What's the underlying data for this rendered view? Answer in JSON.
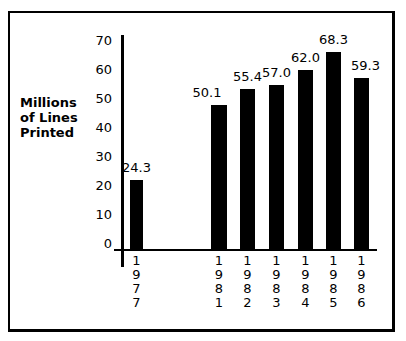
{
  "chart_data": {
    "type": "bar",
    "title": "",
    "xlabel": "",
    "ylabel": "Millions of Lines Printed",
    "ylim": [
      0,
      70
    ],
    "yticks": [
      0,
      10,
      20,
      30,
      40,
      50,
      60,
      70
    ],
    "categories": [
      "1977",
      "1981",
      "1982",
      "1983",
      "1984",
      "1985",
      "1986"
    ],
    "values": [
      24.3,
      50.1,
      55.4,
      57.0,
      62.0,
      68.3,
      59.3
    ],
    "value_labels": [
      "24.3",
      "50.1",
      "55.4",
      "57.0",
      "62.0",
      "68.3",
      "59.3"
    ],
    "grid": false,
    "legend": null
  },
  "labels": {
    "ylabel_lines": "Millions\nof Lines\nPrinted",
    "cut_title": "",
    "yticks": [
      "0",
      "10",
      "20",
      "30",
      "40",
      "50",
      "60",
      "70"
    ],
    "xlabels_vertical": [
      "1\n9\n7\n7",
      "1\n9\n8\n1",
      "1\n9\n8\n2",
      "1\n9\n8\n3",
      "1\n9\n8\n4",
      "1\n9\n8\n5",
      "1\n9\n8\n6"
    ]
  }
}
